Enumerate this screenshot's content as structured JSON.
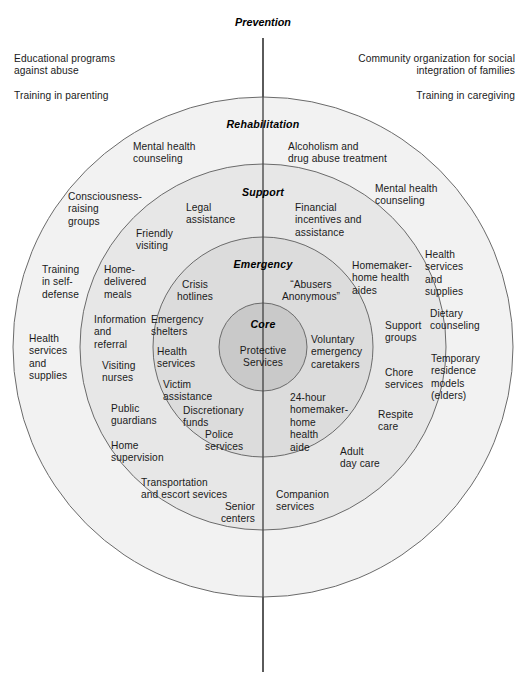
{
  "figure": {
    "type": "concentric-circles-diagram",
    "axis_label": "Prevention",
    "colors": {
      "core_fill": "#c9c9c9",
      "emergency_fill": "#dcdcdc",
      "support_fill": "#e7e7e7",
      "rehabilitation_fill": "#f2f2f2",
      "outside_fill": "#ffffff",
      "stroke": "#6b6b6b",
      "axis_line": "#4a4a4a",
      "text": "#1a1a1a"
    },
    "geometry": {
      "center_x": 263,
      "center_y": 347,
      "radius_core": 44,
      "radius_emergency": 110,
      "radius_support": 183,
      "radius_rehabilitation": 250,
      "axis_top_y": 38,
      "axis_bottom_y": 672
    }
  },
  "rings": {
    "core": {
      "title": "Core"
    },
    "emergency": {
      "title": "Emergency"
    },
    "support": {
      "title": "Support"
    },
    "rehabilitation": {
      "title": "Rehabilitation"
    },
    "prevention": {
      "title": "Prevention"
    }
  },
  "outside_items": {
    "top_left_1": "Educational programs\nagainst abuse",
    "top_left_2": "Training in parenting",
    "top_right_1": "Community organization for social\nintegration of families",
    "top_right_2": "Training in caregiving"
  },
  "core_items": [
    {
      "label": "Protective\nServices"
    }
  ],
  "emergency_items": [
    {
      "label": "Crisis\nhotlines"
    },
    {
      "label": "“Abusers\nAnonymous”"
    },
    {
      "label": "Emergency\nshelters"
    },
    {
      "label": "Health\nservices"
    },
    {
      "label": "Victim\nassistance"
    },
    {
      "label": "Discretionary\nfunds"
    },
    {
      "label": "Police\nservices"
    },
    {
      "label": "Voluntary\nemergency\ncaretakers"
    },
    {
      "label": "24-hour\nhomemaker-\nhome\nhealth\naide"
    }
  ],
  "support_items": [
    {
      "label": "Legal\nassistance"
    },
    {
      "label": "Friendly\nvisiting"
    },
    {
      "label": "Financial\nincentives and\nassistance"
    },
    {
      "label": "Home-\ndelivered\nmeals"
    },
    {
      "label": "Information\nand\nreferral"
    },
    {
      "label": "Visiting\nnurses"
    },
    {
      "label": "Public\nguardians"
    },
    {
      "label": "Home\nsupervision"
    },
    {
      "label": "Transportation\nand escort sevices"
    },
    {
      "label": "Senior\ncenters"
    },
    {
      "label": "Companion\nservices"
    },
    {
      "label": "Adult\nday care"
    },
    {
      "label": "Respite\ncare"
    },
    {
      "label": "Chore\nservices"
    },
    {
      "label": "Support\ngroups"
    },
    {
      "label": "Homemaker-\nhome health\naides"
    }
  ],
  "rehabilitation_items": [
    {
      "label": "Mental health\ncounseling"
    },
    {
      "label": "Alcoholism and\ndrug abuse treatment"
    },
    {
      "label": "Mental health\ncounseling"
    },
    {
      "label": "Consciousness-\nraising\ngroups"
    },
    {
      "label": "Training\nin self-\ndefense"
    },
    {
      "label": "Health\nservices\nand\nsupplies"
    },
    {
      "label": "Health\nservices\nand\nsupplies"
    },
    {
      "label": "Dietary\ncounseling"
    },
    {
      "label": "Temporary\nresidence\nmodels\n(elders)"
    }
  ]
}
